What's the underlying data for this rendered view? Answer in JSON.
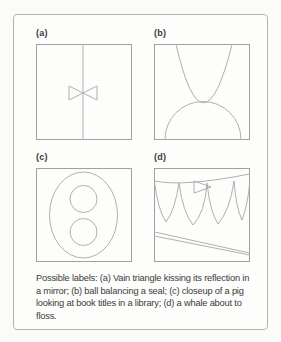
{
  "figure": {
    "panels": [
      {
        "id": "a",
        "label": "(a)",
        "drawing": "triangle-kissing-reflection-drawing"
      },
      {
        "id": "b",
        "label": "(b)",
        "drawing": "ball-balancing-seal-drawing"
      },
      {
        "id": "c",
        "label": "(c)",
        "drawing": "pig-snout-closeup-drawing"
      },
      {
        "id": "d",
        "label": "(d)",
        "drawing": "whale-about-to-floss-drawing"
      }
    ],
    "caption": "Possible labels: (a) Vain triangle kissing its reflection in a mirror; (b) ball balancing a seal; (c) closeup of a pig looking at book titles in a library; (d) a whale about to floss."
  },
  "colors": {
    "card_border": "#b3b3b3",
    "panel_border": "#a0a0a0",
    "drawing_stroke": "#b0b0b0",
    "text": "#3b3b3b",
    "background": "#fbfbf9",
    "card_background": "#fdfdfc"
  }
}
